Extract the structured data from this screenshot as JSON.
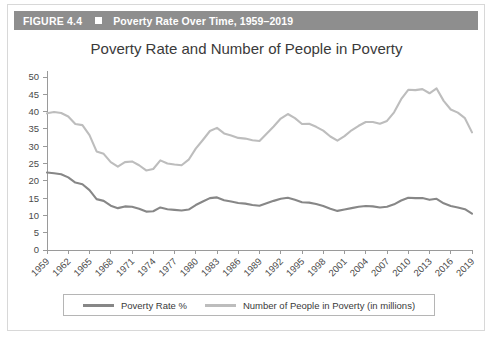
{
  "figure": {
    "number_label": "FIGURE 4.4",
    "bullet_icon": "square-bullet-icon",
    "caption": "Poverty Rate Over Time, 1959–2019",
    "header_bg": "#8e8e8e",
    "header_text_color": "#ffffff"
  },
  "chart_data": {
    "type": "line",
    "title": "Poverty Rate and Number of People in Poverty",
    "xlabel": "",
    "ylabel": "",
    "ylim": [
      0,
      50
    ],
    "ytick_step": 5,
    "yticks": [
      0,
      5,
      10,
      15,
      20,
      25,
      30,
      35,
      40,
      45,
      50
    ],
    "grid": false,
    "legend_position": "bottom",
    "xtick_labels": [
      "1959",
      "1962",
      "1965",
      "1968",
      "1971",
      "1974",
      "1977",
      "1980",
      "1983",
      "1986",
      "1989",
      "1992",
      "1995",
      "1998",
      "2001",
      "2004",
      "2007",
      "2010",
      "2013",
      "2016",
      "2019"
    ],
    "x": [
      1959,
      1960,
      1961,
      1962,
      1963,
      1964,
      1965,
      1966,
      1967,
      1968,
      1969,
      1970,
      1971,
      1972,
      1973,
      1974,
      1975,
      1976,
      1977,
      1978,
      1979,
      1980,
      1981,
      1982,
      1983,
      1984,
      1985,
      1986,
      1987,
      1988,
      1989,
      1990,
      1991,
      1992,
      1993,
      1994,
      1995,
      1996,
      1997,
      1998,
      1999,
      2000,
      2001,
      2002,
      2003,
      2004,
      2005,
      2006,
      2007,
      2008,
      2009,
      2010,
      2011,
      2012,
      2013,
      2014,
      2015,
      2016,
      2017,
      2018,
      2019
    ],
    "series": [
      {
        "name": "Poverty Rate %",
        "color": "#878787",
        "unit": "percent",
        "values": [
          22.4,
          22.2,
          21.9,
          21.0,
          19.5,
          19.0,
          17.3,
          14.7,
          14.2,
          12.8,
          12.1,
          12.6,
          12.5,
          11.9,
          11.1,
          11.2,
          12.3,
          11.8,
          11.6,
          11.4,
          11.7,
          13.0,
          14.0,
          15.0,
          15.2,
          14.4,
          14.0,
          13.6,
          13.4,
          13.0,
          12.8,
          13.5,
          14.2,
          14.8,
          15.1,
          14.5,
          13.8,
          13.7,
          13.3,
          12.7,
          11.9,
          11.3,
          11.7,
          12.1,
          12.5,
          12.7,
          12.6,
          12.3,
          12.5,
          13.2,
          14.3,
          15.1,
          15.0,
          15.0,
          14.5,
          14.8,
          13.5,
          12.7,
          12.3,
          11.8,
          10.5
        ]
      },
      {
        "name": "Number of People in Poverty (in millions)",
        "color": "#bdbdbd",
        "unit": "millions",
        "values": [
          39.5,
          39.9,
          39.6,
          38.6,
          36.4,
          36.1,
          33.2,
          28.5,
          27.8,
          25.4,
          24.1,
          25.4,
          25.6,
          24.5,
          23.0,
          23.4,
          25.9,
          25.0,
          24.7,
          24.5,
          26.1,
          29.3,
          31.8,
          34.4,
          35.3,
          33.7,
          33.1,
          32.4,
          32.2,
          31.7,
          31.5,
          33.6,
          35.7,
          38.0,
          39.3,
          38.1,
          36.4,
          36.5,
          35.6,
          34.5,
          32.8,
          31.6,
          32.9,
          34.6,
          35.9,
          37.0,
          37.0,
          36.5,
          37.3,
          39.8,
          43.6,
          46.3,
          46.2,
          46.5,
          45.3,
          46.7,
          43.1,
          40.6,
          39.7,
          38.1,
          34.0
        ]
      }
    ]
  },
  "legend": {
    "entries": [
      {
        "label": "Poverty Rate %",
        "color": "#878787"
      },
      {
        "label": "Number of People in Poverty (in millions)",
        "color": "#bdbdbd"
      }
    ]
  }
}
